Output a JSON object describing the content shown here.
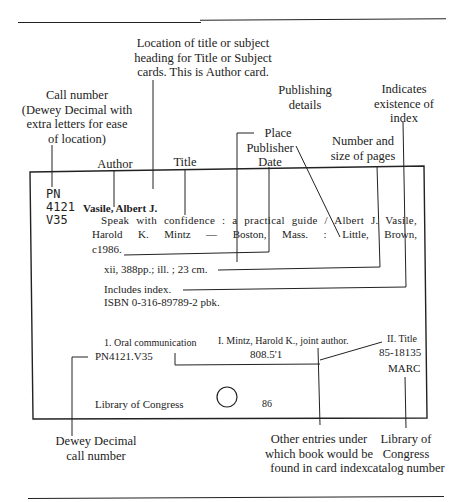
{
  "annotations": {
    "location_heading": [
      "Location of title or subject",
      "heading for Title or Subject",
      "cards. This is Author card."
    ],
    "call_number": [
      "Call number",
      "(Dewey Decimal with",
      "extra letters for ease",
      "of location)"
    ],
    "publishing_details": [
      "Publishing",
      "details"
    ],
    "index_existence": [
      "Indicates",
      "existence of",
      "index"
    ],
    "author": "Author",
    "title": "Title",
    "place_publisher_date": [
      "Place",
      "Publisher",
      "Date"
    ],
    "pages_size": [
      "Number and",
      "size of pages"
    ],
    "dewey_decimal": [
      "Dewey Decimal",
      "call number"
    ],
    "other_entries": [
      "Other entries under",
      "which book would be",
      "found in card index"
    ],
    "loc_catalog": [
      "Library of",
      "Congress",
      "catalog number"
    ]
  },
  "card": {
    "call_number": [
      "PN",
      "4121",
      "V35"
    ],
    "author_heading": "Vasile, Albert J.",
    "title_line1_left": "Speak with confidence : a practical guide / Albert J. Vasile,",
    "title_line2": "Harold K. Mintz — Boston, Mass. : Little, Brown,",
    "title_line3": "c1986.",
    "collation": "xii, 388pp.; ill. ; 23 cm.",
    "notes": "Includes index.",
    "isbn": "ISBN 0-316-89789-2 pbk.",
    "tracing_subject": "1. Oral communication",
    "tracing_added": "I. Mintz, Harold K., joint author.",
    "tracing_title": "II. Title",
    "lc_call": "PN4121.V35",
    "dewey": "808.5'1",
    "lccn": "85-18135",
    "marc": "MARC",
    "library": "Library of Congress",
    "year_code": "86"
  }
}
